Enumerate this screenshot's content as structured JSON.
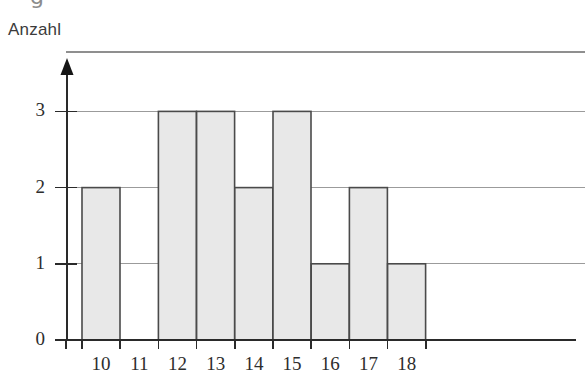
{
  "stray_mark": {
    "glyph": "g",
    "note": "partial cropped character at top edge"
  },
  "axis_title": "Anzahl",
  "chart_data": {
    "type": "bar",
    "title": "",
    "subtitle": "",
    "xlabel": "",
    "ylabel": "Anzahl",
    "categories": [
      "10",
      "11",
      "12",
      "13",
      "14",
      "15",
      "16",
      "17",
      "18"
    ],
    "values": [
      2,
      0,
      3,
      3,
      2,
      3,
      1,
      2,
      1
    ],
    "x_tick_labels": [
      "10",
      "11",
      "12",
      "13",
      "14",
      "15",
      "16",
      "17",
      "18"
    ],
    "y_tick_labels": [
      "0",
      "1",
      "2",
      "3"
    ],
    "y_tick_values": [
      0,
      1,
      2,
      3
    ],
    "ylim": [
      0,
      3.75
    ],
    "grid": true,
    "grid_axis": "y",
    "legend": false,
    "legend_position": "none",
    "bar_fill_color": "#e8e8e8",
    "bar_edge_color": "#4a4a4a",
    "grid_color": "#9b9b9b",
    "axis_color": "#2a2a2a",
    "background_color": "#ffffff",
    "y_axis_arrow": true
  }
}
